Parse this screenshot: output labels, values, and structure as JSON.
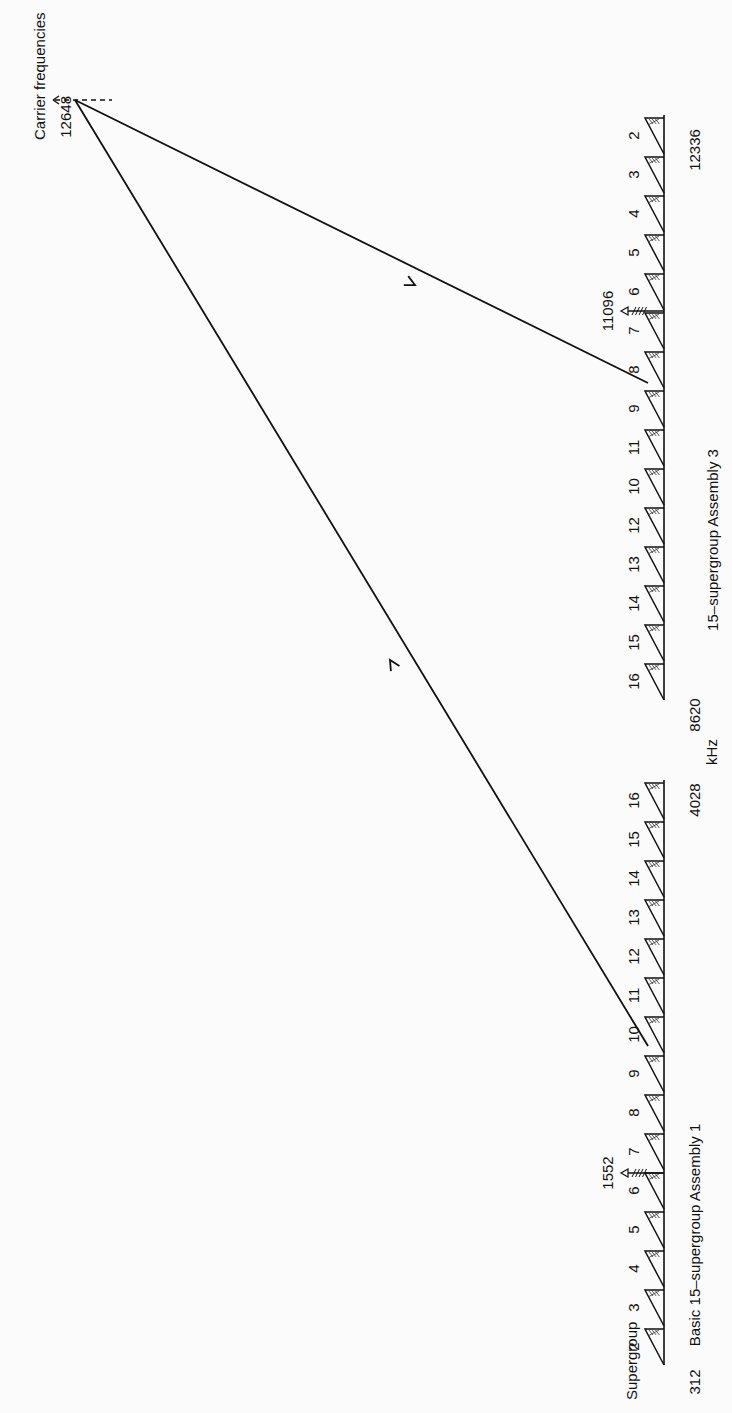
{
  "title": "Carrier frequencies",
  "unit_label": "kHz",
  "supergroup_label": "Supergroup",
  "carrier": {
    "value": "12648",
    "point": [
      75,
      100
    ]
  },
  "assembly1": {
    "caption": "Basic 15–supergroup Assembly 1",
    "low_freq": "312",
    "high_freq": "4028",
    "pilot": {
      "label": "1552",
      "y": 1173
    },
    "baseline_x": 664,
    "y_start": 1365,
    "y_end": 780,
    "supergroups": [
      "2",
      "3",
      "4",
      "5",
      "6",
      "7",
      "8",
      "9",
      "10",
      "11",
      "12",
      "13",
      "14",
      "15",
      "16"
    ],
    "orientation": "erect",
    "caption_pos": [
      700,
      1235
    ],
    "low_pos": [
      700,
      1382
    ],
    "high_pos": [
      700,
      800
    ],
    "link_sg": "9",
    "arrow_direction": "up"
  },
  "assembly3": {
    "caption": "15–supergroup Assembly 3",
    "low_freq": "8620",
    "high_freq": "12336",
    "pilot": {
      "label": "11096",
      "y": 311
    },
    "baseline_x": 664,
    "y_start": 700,
    "y_end": 115,
    "supergroups": [
      "16",
      "15",
      "14",
      "13",
      "12",
      "10",
      "11",
      "9",
      "8",
      "7",
      "6",
      "5",
      "4",
      "3",
      "2"
    ],
    "orientation": "inverted",
    "caption_pos": [
      718,
      540
    ],
    "low_pos": [
      700,
      715
    ],
    "high_pos": [
      700,
      150
    ],
    "link_sg": "9",
    "arrow_direction": "down"
  },
  "links": [
    {
      "from": [
        75,
        100
      ],
      "to": [
        648,
        383
      ],
      "arrow_at": [
        415,
        285
      ],
      "arrow": "toward-assembly3"
    },
    {
      "from": [
        648,
        1046
      ],
      "to": [
        75,
        100
      ],
      "arrow_at": [
        390,
        660
      ],
      "arrow": "toward-carrier"
    }
  ],
  "colors": {
    "ink": "#111111",
    "paper": "#fbfbfb"
  }
}
